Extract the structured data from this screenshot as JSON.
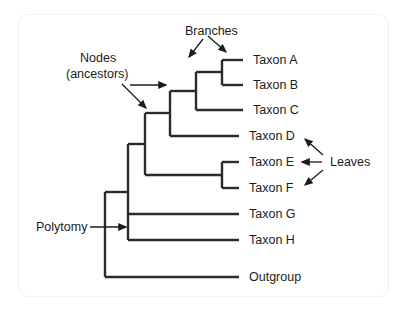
{
  "figure": {
    "background_color": "#ffffff",
    "line_color": "#2b2b2b",
    "text_color": "#1c1c1c",
    "frame_color": "#f0f0f0"
  },
  "taxa": [
    {
      "id": "taxon-a",
      "label": "Taxon A",
      "x": 253,
      "y": 60
    },
    {
      "id": "taxon-b",
      "label": "Taxon B",
      "x": 253,
      "y": 85
    },
    {
      "id": "taxon-c",
      "label": "Taxon C",
      "x": 253,
      "y": 110
    },
    {
      "id": "taxon-d",
      "label": "Taxon D",
      "x": 249,
      "y": 136
    },
    {
      "id": "taxon-e",
      "label": "Taxon E",
      "x": 249,
      "y": 162
    },
    {
      "id": "taxon-f",
      "label": "Taxon F",
      "x": 249,
      "y": 188
    },
    {
      "id": "taxon-g",
      "label": "Taxon G",
      "x": 249,
      "y": 214
    },
    {
      "id": "taxon-h",
      "label": "Taxon H",
      "x": 249,
      "y": 240
    },
    {
      "id": "outgroup",
      "label": "Outgroup",
      "x": 249,
      "y": 277
    }
  ],
  "annotations": {
    "branches": {
      "label": "Branches",
      "x": 185,
      "y": 31
    },
    "nodes_line1": {
      "label": "Nodes",
      "x": 80,
      "y": 58
    },
    "nodes_line2": {
      "label": "(ancestors)",
      "x": 66,
      "y": 74
    },
    "leaves": {
      "label": "Leaves",
      "x": 330,
      "y": 162
    },
    "polytomy": {
      "label": "Polytomy",
      "x": 36,
      "y": 227
    }
  },
  "tree_structure": {
    "description": "Rooted phylogenetic tree with nine tips and one polytomy",
    "root_x": 105,
    "tip_x_upper": 243,
    "tip_x_lower": 239,
    "nodes": [
      {
        "id": "node-ab",
        "x": 222,
        "children": [
          "taxon-a",
          "taxon-b"
        ]
      },
      {
        "id": "node-abc",
        "x": 196,
        "children": [
          "node-ab",
          "taxon-c"
        ]
      },
      {
        "id": "node-abcd",
        "x": 170,
        "children": [
          "node-abc",
          "taxon-d"
        ]
      },
      {
        "id": "node-ef",
        "x": 222,
        "children": [
          "taxon-e",
          "taxon-f"
        ]
      },
      {
        "id": "node-abcdef",
        "x": 145,
        "children": [
          "node-abcd",
          "node-ef"
        ]
      },
      {
        "id": "node-polytomy",
        "x": 128,
        "children": [
          "node-abcdef",
          "taxon-g",
          "taxon-h"
        ]
      },
      {
        "id": "node-root",
        "x": 105,
        "children": [
          "node-polytomy",
          "outgroup"
        ]
      }
    ]
  }
}
